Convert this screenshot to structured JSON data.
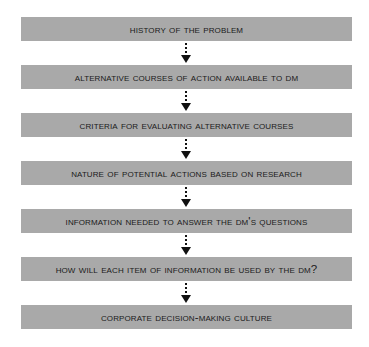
{
  "diagram": {
    "type": "vertical-flowchart",
    "box_color": "#a9a9a9",
    "steps": [
      {
        "label": "History of the Problem"
      },
      {
        "label": "Alternative Courses of Action Available to DM"
      },
      {
        "label": "Criteria for Evaluating Alternative Courses"
      },
      {
        "label": "Nature of Potential Actions Based on Research"
      },
      {
        "label": "Information Needed to Answer the DM's Questions"
      },
      {
        "label": "How Will Each Item of Information Be Used by the DM?"
      },
      {
        "label": "Corporate Decision-Making Culture"
      }
    ]
  }
}
